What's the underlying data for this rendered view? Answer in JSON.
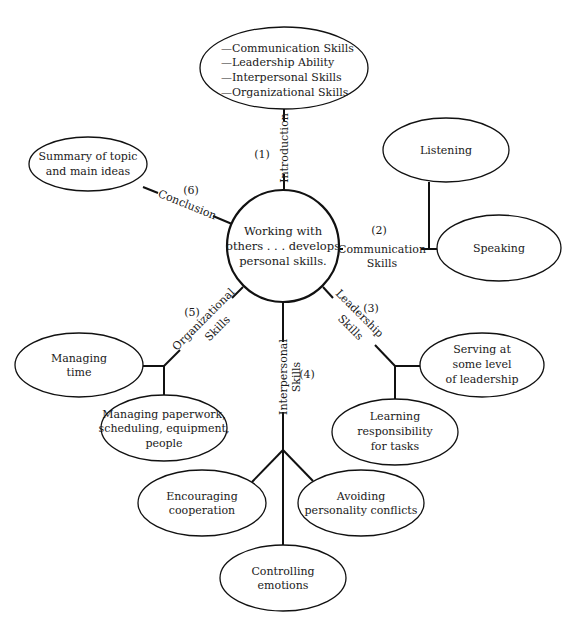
{
  "center": {
    "lines": [
      "Working with",
      "others . . . develops",
      "personal skills."
    ]
  },
  "branches": {
    "introduction": {
      "number": "(1)",
      "label": [
        "Introduction"
      ],
      "children": [
        {
          "lines": [
            "—Communication Skills",
            "—Leadership Ability",
            "—Interpersonal Skills",
            "—Organizational Skills"
          ]
        }
      ]
    },
    "communication": {
      "number": "(2)",
      "label": [
        "Communication",
        "Skills"
      ],
      "children": [
        {
          "lines": [
            "Listening"
          ]
        },
        {
          "lines": [
            "Speaking"
          ]
        }
      ]
    },
    "leadership": {
      "number": "(3)",
      "label": [
        "Leadership",
        "Skills"
      ],
      "children": [
        {
          "lines": [
            "Serving at",
            "some level",
            "of leadership"
          ]
        },
        {
          "lines": [
            "Learning",
            "responsibility",
            "for tasks"
          ]
        }
      ]
    },
    "interpersonal": {
      "number": "(4)",
      "label": [
        "Interpersonal",
        "Skills"
      ],
      "children": [
        {
          "lines": [
            "Encouraging",
            "cooperation"
          ]
        },
        {
          "lines": [
            "Avoiding",
            "personality conflicts"
          ]
        },
        {
          "lines": [
            "Controlling",
            "emotions"
          ]
        }
      ]
    },
    "organizational": {
      "number": "(5)",
      "label": [
        "Organizational",
        "Skills"
      ],
      "children": [
        {
          "lines": [
            "Managing",
            "time"
          ]
        },
        {
          "lines": [
            "Managing paperwork,",
            "scheduling, equipment,",
            "people"
          ]
        }
      ]
    },
    "conclusion": {
      "number": "(6)",
      "label": [
        "Conclusion"
      ],
      "children": [
        {
          "lines": [
            "Summary of topic",
            "and main ideas"
          ]
        }
      ]
    }
  }
}
